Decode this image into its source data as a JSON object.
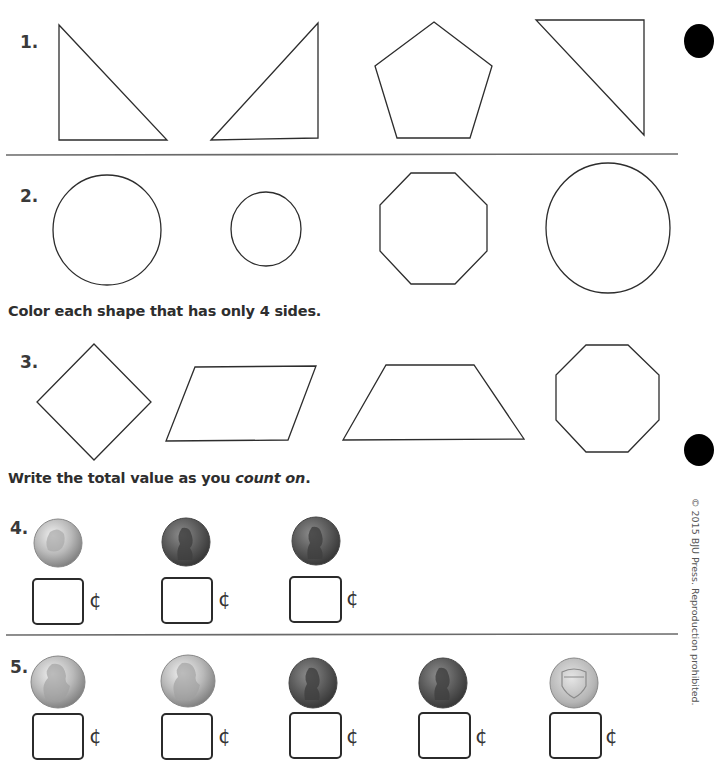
{
  "problems": {
    "p1": {
      "number": "1."
    },
    "p2": {
      "number": "2."
    },
    "p3": {
      "number": "3."
    },
    "p4": {
      "number": "4."
    },
    "p5": {
      "number": "5."
    }
  },
  "instructions": {
    "color_four_sides": "Color each shape that has only 4 sides.",
    "count_on_prefix": "Write the total value as you ",
    "count_on_emphasis": "count on",
    "count_on_suffix": "."
  },
  "shapes": {
    "row1": [
      "right-triangle",
      "right-triangle",
      "pentagon",
      "right-triangle"
    ],
    "row2": [
      "circle",
      "circle",
      "octagon",
      "circle"
    ],
    "row3": [
      "square-rotated",
      "parallelogram",
      "trapezoid",
      "octagon"
    ]
  },
  "coins": {
    "row4": [
      "dime",
      "penny",
      "penny"
    ],
    "row5": [
      "nickel",
      "nickel",
      "penny",
      "penny",
      "penny-shield"
    ]
  },
  "answer_boxes": {
    "cent_symbol": "¢",
    "row4_values": [
      "",
      "",
      ""
    ],
    "row5_values": [
      "",
      "",
      "",
      "",
      ""
    ]
  },
  "footer": {
    "copyright": "© 2015 BJU Press. Reproduction prohibited."
  },
  "colors": {
    "ink": "#2d2d2d",
    "divider": "#6a6a6a",
    "binder_hole": "#000000"
  }
}
